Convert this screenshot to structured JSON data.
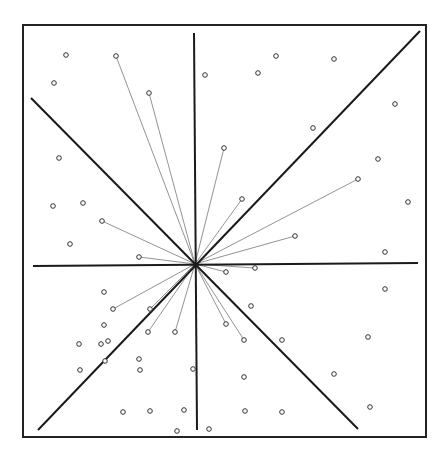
{
  "figure": {
    "width": 447,
    "height": 459,
    "background": "#ffffff",
    "frame": {
      "x1": 23,
      "y1": 25,
      "x2": 426,
      "y2": 437,
      "color": "#222222",
      "stroke_width": 2
    },
    "center": {
      "x": 195,
      "y": 264
    },
    "axes": [
      {
        "name": "vertical-axis",
        "x1": 194,
        "y1": 33,
        "x2": 197,
        "y2": 430
      },
      {
        "name": "horizontal-axis",
        "x1": 33,
        "y1": 266,
        "x2": 418,
        "y2": 263
      },
      {
        "name": "diagonal-ne",
        "x1": 38,
        "y1": 430,
        "x2": 420,
        "y2": 31
      },
      {
        "name": "diagonal-nw",
        "x1": 31,
        "y1": 98,
        "x2": 358,
        "y2": 429
      }
    ],
    "axis_color": "#1a1a1a",
    "axis_stroke_width": 2,
    "ray_color": "#777777",
    "ray_stroke_width": 0.8,
    "point_color": "#333333",
    "point_radius": 2.3,
    "connected_points": [
      [
        116,
        56
      ],
      [
        149,
        93
      ],
      [
        224,
        148
      ],
      [
        242,
        199
      ],
      [
        358,
        179
      ],
      [
        295,
        236
      ],
      [
        102,
        221
      ],
      [
        139,
        257
      ],
      [
        255,
        268
      ],
      [
        226,
        272
      ],
      [
        113,
        309
      ],
      [
        150,
        309
      ],
      [
        148,
        332
      ],
      [
        175,
        332
      ],
      [
        226,
        324
      ],
      [
        244,
        340
      ]
    ],
    "isolated_points": [
      [
        66,
        55
      ],
      [
        54,
        83
      ],
      [
        205,
        75
      ],
      [
        258,
        73
      ],
      [
        276,
        56
      ],
      [
        313,
        128
      ],
      [
        334,
        59
      ],
      [
        395,
        104
      ],
      [
        378,
        159
      ],
      [
        408,
        202
      ],
      [
        385,
        252
      ],
      [
        59,
        158
      ],
      [
        53,
        206
      ],
      [
        83,
        203
      ],
      [
        70,
        244
      ],
      [
        104,
        292
      ],
      [
        104,
        325
      ],
      [
        79,
        344
      ],
      [
        101,
        344
      ],
      [
        108,
        341
      ],
      [
        105,
        361
      ],
      [
        139,
        359
      ],
      [
        80,
        370
      ],
      [
        140,
        370
      ],
      [
        193,
        369
      ],
      [
        123,
        412
      ],
      [
        150,
        411
      ],
      [
        184,
        410
      ],
      [
        177,
        431
      ],
      [
        209,
        429
      ],
      [
        245,
        411
      ],
      [
        282,
        412
      ],
      [
        385,
        289
      ],
      [
        251,
        306
      ],
      [
        282,
        340
      ],
      [
        368,
        337
      ],
      [
        244,
        377
      ],
      [
        334,
        374
      ],
      [
        370,
        407
      ]
    ]
  }
}
